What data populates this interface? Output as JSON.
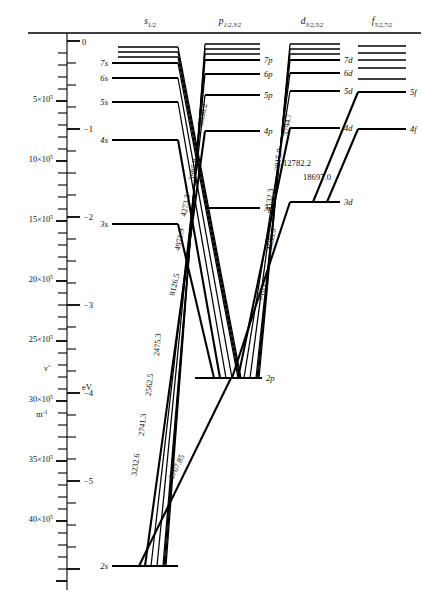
{
  "figure": {
    "type": "grotrian-energy-level-diagram",
    "element": "lithium"
  },
  "columns": [
    {
      "id": "s",
      "head": "s",
      "sub": "1/2",
      "x": 150
    },
    {
      "id": "p",
      "head": "p",
      "sub": "1/2,3/2",
      "x": 230
    },
    {
      "id": "d",
      "head": "d",
      "sub": "3/2,5/2",
      "x": 312
    },
    {
      "id": "f",
      "head": "f",
      "sub": "5/2,7/2",
      "x": 382
    }
  ],
  "axes": {
    "left": {
      "symbol": "ν̃",
      "unit": "m−1",
      "unit_display": "m",
      "unit_sup": "-1",
      "ticks": [
        {
          "label": "5×10",
          "sup": "5",
          "value": 500000,
          "y": 99
        },
        {
          "label": "10×10",
          "sup": "5",
          "value": 1000000,
          "y": 159
        },
        {
          "label": "15×10",
          "sup": "5",
          "value": 1500000,
          "y": 219
        },
        {
          "label": "20×10",
          "sup": "5",
          "value": 2000000,
          "y": 279
        },
        {
          "label": "25×10",
          "sup": "5",
          "value": 2500000,
          "y": 339
        },
        {
          "label": "30×10",
          "sup": "5",
          "value": 3000000,
          "y": 399
        },
        {
          "label": "35×10",
          "sup": "5",
          "value": 3500000,
          "y": 459
        },
        {
          "label": "40×10",
          "sup": "5",
          "value": 4000000,
          "y": 519
        }
      ]
    },
    "right": {
      "unit": "eV",
      "ticks": [
        {
          "label": "0",
          "value": 0,
          "y": 41
        },
        {
          "label": "−1",
          "value": -1,
          "y": 129
        },
        {
          "label": "−2",
          "value": -2,
          "y": 217
        },
        {
          "label": "−3",
          "value": -3,
          "y": 305
        },
        {
          "label": "−4",
          "value": -4,
          "y": 393
        },
        {
          "label": "−5",
          "value": -5,
          "y": 481
        }
      ]
    }
  },
  "levels": {
    "s": [
      {
        "label": "8s",
        "x1": 118,
        "x2": 178,
        "y": 47,
        "show_label": false
      },
      {
        "label": "9s",
        "x1": 118,
        "x2": 178,
        "y": 52,
        "show_label": false
      },
      {
        "label": "10s",
        "x1": 118,
        "x2": 178,
        "y": 57,
        "show_label": false
      },
      {
        "label": "7s",
        "x1": 112,
        "x2": 178,
        "y": 63,
        "show_label": true
      },
      {
        "label": "6s",
        "x1": 112,
        "x2": 178,
        "y": 78,
        "show_label": true
      },
      {
        "label": "5s",
        "x1": 112,
        "x2": 178,
        "y": 102,
        "show_label": true
      },
      {
        "label": "4s",
        "x1": 112,
        "x2": 178,
        "y": 140,
        "show_label": true
      },
      {
        "label": "3s",
        "x1": 112,
        "x2": 178,
        "y": 224,
        "show_label": true
      },
      {
        "label": "2s",
        "x1": 112,
        "x2": 178,
        "y": 566,
        "show_label": true
      }
    ],
    "p": [
      {
        "label": "8p",
        "x1": 205,
        "x2": 260,
        "y": 44,
        "show_label": false
      },
      {
        "label": "9p",
        "x1": 205,
        "x2": 260,
        "y": 49,
        "show_label": false
      },
      {
        "label": "10p",
        "x1": 205,
        "x2": 260,
        "y": 54,
        "show_label": false
      },
      {
        "label": "7p",
        "x1": 205,
        "x2": 260,
        "y": 60,
        "show_label": true
      },
      {
        "label": "6p",
        "x1": 205,
        "x2": 260,
        "y": 74,
        "show_label": true
      },
      {
        "label": "5p",
        "x1": 205,
        "x2": 260,
        "y": 95,
        "show_label": true
      },
      {
        "label": "4p",
        "x1": 205,
        "x2": 260,
        "y": 131,
        "show_label": true
      },
      {
        "label": "3p",
        "x1": 205,
        "x2": 260,
        "y": 208,
        "show_label": true
      },
      {
        "label": "2p",
        "x1": 195,
        "x2": 262,
        "y": 378,
        "show_label": true
      }
    ],
    "d": [
      {
        "label": "8d",
        "x1": 290,
        "x2": 340,
        "y": 44,
        "show_label": false
      },
      {
        "label": "9d",
        "x1": 290,
        "x2": 340,
        "y": 49,
        "show_label": false
      },
      {
        "label": "10d",
        "x1": 290,
        "x2": 340,
        "y": 54,
        "show_label": false
      },
      {
        "label": "7d",
        "x1": 290,
        "x2": 340,
        "y": 60,
        "show_label": true
      },
      {
        "label": "6d",
        "x1": 290,
        "x2": 340,
        "y": 73,
        "show_label": true
      },
      {
        "label": "5d",
        "x1": 290,
        "x2": 340,
        "y": 91,
        "show_label": true
      },
      {
        "label": "4d",
        "x1": 290,
        "x2": 340,
        "y": 128,
        "show_label": true
      },
      {
        "label": "3d",
        "x1": 290,
        "x2": 340,
        "y": 202,
        "show_label": true
      }
    ],
    "f": [
      {
        "label": "8f",
        "x1": 358,
        "x2": 406,
        "y": 46,
        "show_label": false
      },
      {
        "label": "9f",
        "x1": 358,
        "x2": 406,
        "y": 53,
        "show_label": false
      },
      {
        "label": "10f",
        "x1": 358,
        "x2": 406,
        "y": 60,
        "show_label": false
      },
      {
        "label": "7f",
        "x1": 358,
        "x2": 406,
        "y": 68,
        "show_label": false
      },
      {
        "label": "6f",
        "x1": 358,
        "x2": 406,
        "y": 79,
        "show_label": false
      },
      {
        "label": "5f",
        "x1": 358,
        "x2": 406,
        "y": 92,
        "show_label": true
      },
      {
        "label": "4f",
        "x1": 358,
        "x2": 406,
        "y": 129,
        "show_label": true
      }
    ]
  },
  "transitions": [
    {
      "id": "t-3838",
      "label": "3838.2",
      "from": "7s",
      "to": "2p",
      "x1": 178,
      "y1": 63,
      "x2": 238,
      "y2": 378,
      "lx": 205,
      "ly": 115,
      "rot": -78,
      "weight": "thin"
    },
    {
      "id": "t-3985",
      "label": "3985.8",
      "from": "6s",
      "to": "2p",
      "x1": 178,
      "y1": 78,
      "x2": 232,
      "y2": 378,
      "lx": 196,
      "ly": 170,
      "rot": -79,
      "weight": "thin"
    },
    {
      "id": "t-4273",
      "label": "4273.3",
      "from": "5s",
      "to": "2p",
      "x1": 178,
      "y1": 102,
      "x2": 226,
      "y2": 378,
      "lx": 188,
      "ly": 206,
      "rot": -79,
      "weight": "thin"
    },
    {
      "id": "t-4971",
      "label": "4971.9",
      "from": "4s",
      "to": "2p",
      "x1": 178,
      "y1": 140,
      "x2": 220,
      "y2": 378,
      "lx": 182,
      "ly": 240,
      "rot": -79,
      "weight": "thick"
    },
    {
      "id": "t-8126",
      "label": "8126.5",
      "from": "3s",
      "to": "2p",
      "x1": 178,
      "y1": 224,
      "x2": 214,
      "y2": 378,
      "lx": 177,
      "ly": 285,
      "rot": -77,
      "weight": "thick"
    },
    {
      "id": "t-3794",
      "label": "3794.7",
      "from": "7d",
      "to": "2p",
      "x1": 290,
      "y1": 60,
      "x2": 256,
      "y2": 378,
      "lx": 290,
      "ly": 125,
      "rot": -84,
      "weight": "thin"
    },
    {
      "id": "t-3915",
      "label": "3915.0",
      "from": "6d",
      "to": "2p",
      "x1": 290,
      "y1": 73,
      "x2": 250,
      "y2": 378,
      "lx": 281,
      "ly": 160,
      "rot": -83,
      "weight": "thin"
    },
    {
      "id": "t-4132",
      "label": "4132.3",
      "from": "5d",
      "to": "2p",
      "x1": 290,
      "y1": 91,
      "x2": 244,
      "y2": 378,
      "lx": 272,
      "ly": 200,
      "rot": -82,
      "weight": "thin"
    },
    {
      "id": "t-4603",
      "label": "4603.0",
      "from": "4d",
      "to": "2p",
      "x1": 290,
      "y1": 128,
      "x2": 238,
      "y2": 378,
      "lx": 274,
      "ly": 240,
      "rot": -79,
      "weight": "thick"
    },
    {
      "id": "t-6103",
      "label": "6103.5",
      "from": "3d",
      "to": "2p",
      "x1": 290,
      "y1": 202,
      "x2": 232,
      "y2": 378,
      "lx": 265,
      "ly": 290,
      "rot": -72,
      "weight": "thick"
    },
    {
      "id": "t-2475",
      "label": "2475.3",
      "from": "7p",
      "to": "2s",
      "x1": 205,
      "y1": 60,
      "x2": 163,
      "y2": 566,
      "lx": 160,
      "ly": 345,
      "rot": -85,
      "weight": "thin"
    },
    {
      "id": "t-2562",
      "label": "2562.5",
      "from": "6p",
      "to": "2s",
      "x1": 205,
      "y1": 74,
      "x2": 157,
      "y2": 566,
      "lx": 152,
      "ly": 385,
      "rot": -84,
      "weight": "thin"
    },
    {
      "id": "t-2741",
      "label": "2741.3",
      "from": "5p",
      "to": "2s",
      "x1": 205,
      "y1": 95,
      "x2": 151,
      "y2": 566,
      "lx": 145,
      "ly": 425,
      "rot": -83,
      "weight": "thin"
    },
    {
      "id": "t-3232",
      "label": "3232.6",
      "from": "4p",
      "to": "2s",
      "x1": 205,
      "y1": 131,
      "x2": 145,
      "y2": 566,
      "lx": 138,
      "ly": 465,
      "rot": -82,
      "weight": "thick"
    },
    {
      "id": "t-6707",
      "label": "6707.85",
      "from": "2p",
      "to": "2s",
      "x1": 231,
      "y1": 378,
      "x2": 139,
      "y2": 566,
      "lx": 179,
      "ly": 468,
      "rot": -64,
      "weight": "thick"
    },
    {
      "id": "t-12782",
      "label": "12782.2",
      "from": "5f",
      "to": "3d",
      "x1": 358,
      "y1": 92,
      "x2": 313,
      "y2": 202,
      "lx": 283,
      "ly": 166,
      "rot": 0,
      "weight": "thick"
    },
    {
      "id": "t-18697",
      "label": "18697.0",
      "from": "4f",
      "to": "3d",
      "x1": 358,
      "y1": 129,
      "x2": 327,
      "y2": 202,
      "lx": 303,
      "ly": 180,
      "rot": 0,
      "weight": "thick"
    }
  ],
  "misc": {
    "zero_label": "0"
  }
}
